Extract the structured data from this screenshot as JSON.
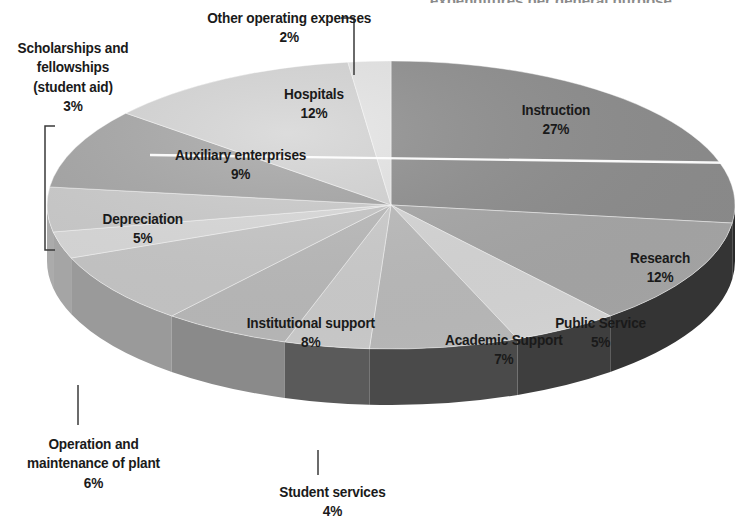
{
  "figure": {
    "background_color": "#ffffff",
    "cropped_title_fragment": "expenditures per general purpose",
    "text_color": "#1a1a1a"
  },
  "chart_data": {
    "type": "pie",
    "title": "",
    "subtitle": "",
    "xlabel": "",
    "ylabel": "",
    "units": "percent",
    "total": 100,
    "three_d": true,
    "start_angle_deg": 0,
    "direction": "clockwise",
    "legend_position": "none",
    "labels_placement": "on-slice-and-outside",
    "categories": [
      "Instruction",
      "Research",
      "Public Service",
      "Academic Support",
      "Student services",
      "Operation and maintenance of plant",
      "Institutional support",
      "Scholarships and fellowships (student aid)",
      "Depreciation",
      "Auxiliary enterprises",
      "Hospitals",
      "Other operating expenses"
    ],
    "values": [
      27,
      12,
      5,
      7,
      4,
      6,
      8,
      3,
      5,
      9,
      12,
      2
    ],
    "value_labels": [
      "27%",
      "12%",
      "5%",
      "7%",
      "4%",
      "6%",
      "8%",
      "3%",
      "5%",
      "9%",
      "12%",
      "2%"
    ],
    "slice_colors": [
      "#8e8e8e",
      "#a8a8a8",
      "#d9d9d9",
      "#bdbdbd",
      "#cfcfcf",
      "#bcbcbc",
      "#c9c9c9",
      "#dcdcdc",
      "#cdcdcd",
      "#a6a6a6",
      "#d5d5d5",
      "#e6e6e6"
    ],
    "side_colors": [
      "#2a2a2a",
      "#343434",
      "#3e3e3e",
      "#4a4a4a",
      "#5a5a5a",
      "#8a8a8a",
      "#9a9a9a",
      "#a5a5a5",
      "#ababab",
      "#b0b0b0",
      "#b6b6b6",
      "#bfbfbf"
    ]
  },
  "slice_labels": [
    {
      "name": "instruction",
      "line1": "Instruction",
      "pct": "27%",
      "x": 517,
      "y": 100
    },
    {
      "name": "research",
      "line1": "Research",
      "pct": "12%",
      "x": 626,
      "y": 248
    },
    {
      "name": "public-service",
      "line1": "Public Service",
      "pct": "5%",
      "x": 549,
      "y": 313
    },
    {
      "name": "academic-support",
      "line1": "Academic Support",
      "pct": "7%",
      "x": 437,
      "y": 330
    },
    {
      "name": "institutional-support",
      "line1": "Institutional support",
      "pct": "8%",
      "x": 238,
      "y": 313
    },
    {
      "name": "depreciation",
      "line1": "Depreciation",
      "pct": "5%",
      "x": 97,
      "y": 209
    },
    {
      "name": "auxiliary-enterprises",
      "line1": "Auxiliary enterprises",
      "pct": "9%",
      "x": 166,
      "y": 145
    },
    {
      "name": "hospitals",
      "line1": "Hospitals",
      "pct": "12%",
      "x": 280,
      "y": 84
    }
  ],
  "callout_labels": [
    {
      "name": "other-operating-expenses",
      "lines": [
        "Other operating expenses"
      ],
      "pct": "2%",
      "x": 196,
      "y": 8,
      "align": "center"
    },
    {
      "name": "scholarships-and-fellowships",
      "lines": [
        "Scholarships and",
        "fellowships",
        "(student aid)"
      ],
      "pct": "3%",
      "x": 10,
      "y": 38,
      "align": "center"
    },
    {
      "name": "operation-and-maintenance-of-plant",
      "lines": [
        "Operation and",
        "maintenance of plant"
      ],
      "pct": "6%",
      "x": 18,
      "y": 434,
      "align": "center"
    },
    {
      "name": "student-services",
      "lines": [
        "Student services"
      ],
      "pct": "4%",
      "x": 272,
      "y": 482,
      "align": "center"
    }
  ],
  "leader_lines": [
    {
      "name": "leader-other-operating-expenses",
      "points": "341,18 354,18 354,75"
    },
    {
      "name": "leader-scholarships-bracket",
      "points": "55,126 45,126 45,250 55,250"
    },
    {
      "name": "leader-operation-maintenance",
      "points": "78,425 78,385"
    },
    {
      "name": "leader-student-services",
      "points": "318,475 318,450"
    }
  ],
  "geometry": {
    "center_x": 391,
    "center_y": 205,
    "radius_x": 344,
    "radius_y": 144,
    "depth": 56
  }
}
